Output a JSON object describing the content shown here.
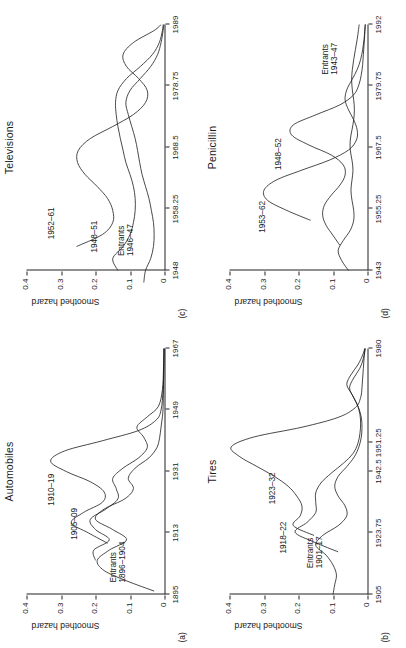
{
  "figure": {
    "orientation": "rotated-90-ccw",
    "ylabel": "Smoothed hazard",
    "yticks": [
      "0",
      "0.1",
      "0.2",
      "0.3",
      "0.4"
    ],
    "ylim": [
      0,
      0.4
    ],
    "line_color": "#1a1a1a",
    "background": "#ffffff"
  },
  "panels": [
    {
      "tag": "(c)",
      "title": "Televisions",
      "xticks": [
        "1948",
        "1958.25",
        "1968.5",
        "1978.75",
        "1989"
      ],
      "xlim": [
        1948,
        1989
      ],
      "labels": [
        {
          "text": "1952–61",
          "x": 1953.2,
          "y": 0.3
        },
        {
          "text": "1948–51",
          "x": 1951.0,
          "y": 0.175
        },
        {
          "text": "Entrants\n1946–47",
          "x": 1950.4,
          "y": 0.095
        }
      ]
    },
    {
      "tag": "(d)",
      "title": "Penicillin",
      "xticks": [
        "1943",
        "1955.25",
        "1967.5",
        "1979.75",
        "1992"
      ],
      "xlim": [
        1943,
        1992
      ],
      "labels": [
        {
          "text": "1953–62",
          "x": 1950.5,
          "y": 0.275
        },
        {
          "text": "1948–52",
          "x": 1963.0,
          "y": 0.23
        },
        {
          "text": "Entrants\n1943–47",
          "x": 1982.0,
          "y": 0.092
        }
      ]
    },
    {
      "tag": "(a)",
      "title": "Automobiles",
      "xticks": [
        "1895",
        "1913",
        "1931",
        "1949",
        "1967"
      ],
      "xlim": [
        1895,
        1967
      ],
      "labels": [
        {
          "text": "1910–19",
          "x": 1921.0,
          "y": 0.3
        },
        {
          "text": "1905–09",
          "x": 1911.0,
          "y": 0.232
        },
        {
          "text": "Entrants\n1896–1904",
          "x": 1898.5,
          "y": 0.118
        }
      ]
    },
    {
      "tag": "(b)",
      "title": "Tires",
      "xticks": [
        "1905",
        "1923.75",
        "1942.5",
        "1951.25",
        "1980"
      ],
      "xlim": [
        1905,
        1980
      ],
      "labels": [
        {
          "text": "1923–32",
          "x": 1932.5,
          "y": 0.245
        },
        {
          "text": "1918–22",
          "x": 1917.5,
          "y": 0.215
        },
        {
          "text": "Entrants\n1901–17",
          "x": 1913.0,
          "y": 0.135
        }
      ]
    }
  ],
  "chart_data": [
    {
      "type": "line",
      "title": "Televisions",
      "panel_tag": "(c)",
      "xlabel": "",
      "ylabel": "Smoothed hazard",
      "xlim": [
        1948,
        1989
      ],
      "ylim": [
        0,
        0.4
      ],
      "xticks": [
        1948,
        1958.25,
        1968.5,
        1978.75,
        1989
      ],
      "yticks": [
        0,
        0.1,
        0.2,
        0.3,
        0.4
      ],
      "grid": false,
      "legend": "inline-curve-labels",
      "series": [
        {
          "name": "1952–61",
          "x": [
            1952,
            1954,
            1956,
            1958,
            1960,
            1962,
            1964,
            1966,
            1968,
            1970,
            1972,
            1974,
            1976,
            1978,
            1980,
            1982,
            1984,
            1986,
            1988,
            1989
          ],
          "y": [
            0.255,
            0.18,
            0.15,
            0.15,
            0.165,
            0.195,
            0.23,
            0.252,
            0.25,
            0.215,
            0.15,
            0.09,
            0.055,
            0.05,
            0.075,
            0.11,
            0.12,
            0.09,
            0.03,
            0.01
          ]
        },
        {
          "name": "1948–51",
          "x": [
            1948,
            1950,
            1952,
            1954,
            1956,
            1958,
            1960,
            1962,
            1964,
            1966,
            1968,
            1970,
            1972,
            1974,
            1976,
            1978,
            1980,
            1982,
            1984,
            1986,
            1988,
            1989
          ],
          "y": [
            0.135,
            0.15,
            0.12,
            0.1,
            0.09,
            0.085,
            0.085,
            0.09,
            0.1,
            0.112,
            0.12,
            0.128,
            0.135,
            0.14,
            0.142,
            0.135,
            0.11,
            0.07,
            0.035,
            0.015,
            0.006,
            0.004
          ]
        },
        {
          "name": "Entrants 1946–47",
          "x": [
            1946,
            1948,
            1950,
            1952,
            1954,
            1956,
            1958,
            1960,
            1962,
            1964,
            1966,
            1968,
            1970,
            1972,
            1974,
            1976,
            1978,
            1980,
            1982,
            1984,
            1986,
            1988,
            1989
          ],
          "y": [
            0.06,
            0.055,
            0.04,
            0.032,
            0.03,
            0.032,
            0.038,
            0.045,
            0.055,
            0.065,
            0.072,
            0.078,
            0.085,
            0.095,
            0.105,
            0.112,
            0.1,
            0.07,
            0.04,
            0.02,
            0.01,
            0.004,
            0.002
          ]
        }
      ]
    },
    {
      "type": "line",
      "title": "Penicillin",
      "panel_tag": "(d)",
      "xlabel": "",
      "ylabel": "Smoothed hazard",
      "xlim": [
        1943,
        1992
      ],
      "ylim": [
        0,
        0.4
      ],
      "xticks": [
        1943,
        1955.25,
        1967.5,
        1979.75,
        1992
      ],
      "yticks": [
        0,
        0.1,
        0.2,
        0.3,
        0.4
      ],
      "grid": false,
      "legend": "inline-curve-labels",
      "series": [
        {
          "name": "1953–62",
          "x": [
            1953,
            1955,
            1957,
            1959,
            1961,
            1963,
            1965,
            1967,
            1969,
            1971,
            1973,
            1975,
            1977,
            1979,
            1981,
            1983,
            1985,
            1987,
            1989,
            1991,
            1992
          ],
          "y": [
            0.165,
            0.235,
            0.29,
            0.3,
            0.265,
            0.19,
            0.11,
            0.055,
            0.032,
            0.03,
            0.04,
            0.055,
            0.065,
            0.06,
            0.045,
            0.03,
            0.02,
            0.014,
            0.01,
            0.008,
            0.007
          ]
        },
        {
          "name": "1948–52",
          "x": [
            1948,
            1950,
            1952,
            1954,
            1956,
            1958,
            1960,
            1962,
            1964,
            1966,
            1968,
            1970,
            1972,
            1974,
            1976,
            1978,
            1980,
            1982,
            1984,
            1986,
            1988,
            1990,
            1992
          ],
          "y": [
            0.08,
            0.1,
            0.12,
            0.13,
            0.125,
            0.105,
            0.08,
            0.065,
            0.07,
            0.105,
            0.17,
            0.22,
            0.215,
            0.15,
            0.08,
            0.04,
            0.025,
            0.018,
            0.014,
            0.012,
            0.01,
            0.008,
            0.006
          ]
        },
        {
          "name": "Entrants 1943–47",
          "x": [
            1943,
            1945,
            1947,
            1949,
            1951,
            1953,
            1955,
            1957,
            1959,
            1961,
            1963,
            1965,
            1967,
            1969,
            1971,
            1973,
            1975,
            1977,
            1979,
            1981,
            1983,
            1985,
            1987,
            1989,
            1991,
            1992
          ],
          "y": [
            0.055,
            0.075,
            0.085,
            0.07,
            0.05,
            0.04,
            0.04,
            0.045,
            0.048,
            0.045,
            0.042,
            0.045,
            0.05,
            0.05,
            0.045,
            0.04,
            0.038,
            0.04,
            0.044,
            0.046,
            0.044,
            0.04,
            0.035,
            0.03,
            0.026,
            0.024
          ]
        }
      ]
    },
    {
      "type": "line",
      "title": "Automobiles",
      "panel_tag": "(a)",
      "xlabel": "",
      "ylabel": "Smoothed hazard",
      "xlim": [
        1895,
        1967
      ],
      "ylim": [
        0,
        0.4
      ],
      "xticks": [
        1895,
        1913,
        1931,
        1949,
        1967
      ],
      "yticks": [
        0,
        0.1,
        0.2,
        0.3,
        0.4
      ],
      "grid": false,
      "legend": "inline-curve-labels",
      "series": [
        {
          "name": "1910–19",
          "x": [
            1910,
            1913,
            1916,
            1919,
            1922,
            1925,
            1928,
            1931,
            1934,
            1937,
            1940,
            1943,
            1946,
            1949,
            1955,
            1961,
            1967
          ],
          "y": [
            0.165,
            0.22,
            0.27,
            0.235,
            0.18,
            0.175,
            0.215,
            0.285,
            0.33,
            0.29,
            0.18,
            0.075,
            0.025,
            0.01,
            0.004,
            0.002,
            0.001
          ]
        },
        {
          "name": "1905–09",
          "x": [
            1905,
            1908,
            1911,
            1914,
            1917,
            1920,
            1923,
            1926,
            1929,
            1932,
            1935,
            1938,
            1941,
            1944,
            1947,
            1950,
            1955,
            1961,
            1967
          ],
          "y": [
            0.2,
            0.205,
            0.16,
            0.2,
            0.215,
            0.17,
            0.135,
            0.14,
            0.15,
            0.12,
            0.075,
            0.05,
            0.06,
            0.08,
            0.05,
            0.018,
            0.006,
            0.003,
            0.002
          ]
        },
        {
          "name": "Entrants 1896–1904",
          "x": [
            1896,
            1899,
            1902,
            1905,
            1908,
            1911,
            1914,
            1917,
            1920,
            1923,
            1926,
            1929,
            1932,
            1935,
            1938,
            1941,
            1944,
            1947,
            1950,
            1955,
            1961,
            1967
          ],
          "y": [
            0.03,
            0.11,
            0.175,
            0.195,
            0.16,
            0.11,
            0.15,
            0.2,
            0.175,
            0.115,
            0.09,
            0.105,
            0.085,
            0.045,
            0.022,
            0.014,
            0.01,
            0.006,
            0.004,
            0.003,
            0.002,
            0.001
          ]
        }
      ]
    },
    {
      "type": "line",
      "title": "Tires",
      "panel_tag": "(b)",
      "xlabel": "",
      "ylabel": "Smoothed hazard",
      "xlim": [
        1905,
        1980
      ],
      "ylim": [
        0,
        0.4
      ],
      "xticks": [
        1905,
        1923.75,
        1942.5,
        1951.25,
        1980
      ],
      "yticks": [
        0,
        0.1,
        0.2,
        0.3,
        0.4
      ],
      "grid": false,
      "legend": "inline-curve-labels",
      "series": [
        {
          "name": "1923–32",
          "x": [
            1923,
            1926,
            1929,
            1932,
            1935,
            1938,
            1941,
            1944,
            1947,
            1950,
            1953,
            1956,
            1959,
            1962,
            1965,
            1968,
            1971,
            1974,
            1977,
            1980
          ],
          "y": [
            0.155,
            0.215,
            0.195,
            0.19,
            0.205,
            0.23,
            0.27,
            0.32,
            0.37,
            0.395,
            0.33,
            0.19,
            0.085,
            0.035,
            0.02,
            0.016,
            0.014,
            0.012,
            0.01,
            0.008
          ]
        },
        {
          "name": "1918–22",
          "x": [
            1918,
            1921,
            1924,
            1927,
            1930,
            1933,
            1936,
            1939,
            1942,
            1945,
            1948,
            1951,
            1954,
            1957,
            1960,
            1963,
            1966,
            1969,
            1972,
            1975,
            1978,
            1980
          ],
          "y": [
            0.085,
            0.155,
            0.21,
            0.175,
            0.15,
            0.15,
            0.15,
            0.135,
            0.105,
            0.07,
            0.042,
            0.028,
            0.022,
            0.02,
            0.022,
            0.03,
            0.045,
            0.06,
            0.048,
            0.028,
            0.014,
            0.008
          ]
        },
        {
          "name": "Entrants 1901–17",
          "x": [
            1905,
            1908,
            1911,
            1914,
            1917,
            1920,
            1923,
            1926,
            1929,
            1932,
            1935,
            1938,
            1941,
            1944,
            1947,
            1950,
            1953,
            1956,
            1959,
            1962,
            1965,
            1968,
            1971,
            1974,
            1977,
            1980
          ],
          "y": [
            0.1,
            0.095,
            0.09,
            0.1,
            0.12,
            0.15,
            0.13,
            0.085,
            0.06,
            0.065,
            0.085,
            0.095,
            0.085,
            0.06,
            0.038,
            0.025,
            0.018,
            0.016,
            0.018,
            0.026,
            0.04,
            0.052,
            0.04,
            0.022,
            0.012,
            0.006
          ]
        }
      ]
    }
  ]
}
